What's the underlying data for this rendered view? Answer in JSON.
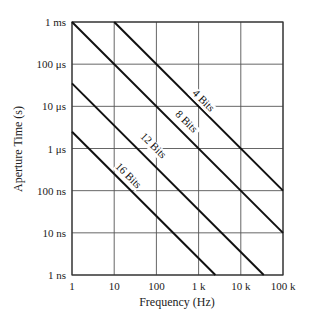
{
  "chart_data": {
    "type": "line",
    "title": "",
    "xlabel": "Frequency (Hz)",
    "ylabel": "Aperture Time (s)",
    "xscale": "log",
    "yscale": "log",
    "xlim": [
      1,
      100000
    ],
    "ylim": [
      1e-09,
      0.001
    ],
    "grid": true,
    "x_ticks": [
      1,
      10,
      100,
      1000,
      10000,
      100000
    ],
    "x_tick_labels": [
      "1",
      "10",
      "100",
      "1 k",
      "10 k",
      "100 k"
    ],
    "y_ticks": [
      0.001,
      0.0001,
      1e-05,
      1e-06,
      1e-07,
      1e-08,
      1e-09
    ],
    "y_tick_labels": [
      "1 ms",
      "100 μs",
      "10 μs",
      "1 μs",
      "100 ns",
      "10 ns",
      "1 ns"
    ],
    "legend": "inline labels on lines",
    "series": [
      {
        "name": "4 Bits",
        "x": [
          10,
          100000
        ],
        "y": [
          0.001,
          1e-07
        ]
      },
      {
        "name": "8 Bits",
        "x": [
          1,
          100000
        ],
        "y": [
          0.001,
          1e-08
        ]
      },
      {
        "name": "12 Bits",
        "x": [
          1,
          35000
        ],
        "y": [
          3.5e-05,
          1e-09
        ]
      },
      {
        "name": "16 Bits",
        "x": [
          1,
          2500
        ],
        "y": [
          2.5e-06,
          1e-09
        ]
      }
    ]
  }
}
